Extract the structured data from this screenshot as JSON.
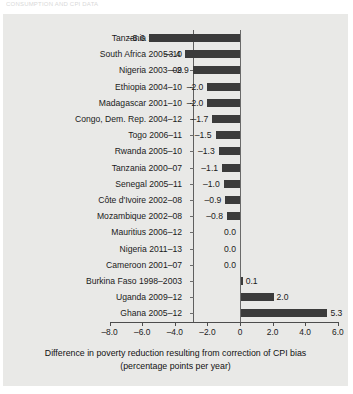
{
  "header": {
    "cut_off_text": "CONSUMPTION AND CPI DATA"
  },
  "chart_data": {
    "type": "bar",
    "orientation": "horizontal",
    "title": "",
    "xlabel": "Difference in poverty reduction resulting from correction of CPI bias (percentage points per year)",
    "ylabel": "",
    "xlim": [
      -8.0,
      6.6
    ],
    "xticks": [
      -8.0,
      -6.0,
      -4.0,
      -2.0,
      0,
      2.0,
      4.0,
      6.0
    ],
    "xtick_labels": [
      "–8.0",
      "–6.0",
      "–4.0",
      "–2.0",
      "0",
      "2.0",
      "4.0",
      "6.0"
    ],
    "grid": false,
    "legend": null,
    "bar_color": "#3b3b3b",
    "panel_color": "#e9e9e7",
    "categories": [
      "Tanzania 2008–12",
      "South Africa 2005–10",
      "Nigeria 2003–09",
      "Ethiopia 2004–10",
      "Madagascar 2001–10",
      "Congo, Dem. Rep. 2004–12",
      "Togo 2006–11",
      "Rwanda 2005–10",
      "Tanzania 2000–07",
      "Senegal 2005–11",
      "Côte d'Ivoire 2002–08",
      "Mozambique 2002–08",
      "Mauritius 2006–12",
      "Nigeria 2011–13",
      "Cameroon 2001–07",
      "Burkina Faso 1998–2003",
      "Uganda 2009–12",
      "Ghana 2005–12"
    ],
    "values": [
      -5.6,
      -3.4,
      -2.9,
      -2.0,
      -2.0,
      -1.7,
      -1.5,
      -1.3,
      -1.1,
      -1.0,
      -0.9,
      -0.8,
      0.0,
      0.0,
      0.0,
      0.1,
      2.0,
      5.3
    ],
    "value_labels": [
      "–5.6",
      "–3.4",
      "–2.9",
      "–2.0",
      "–2.0",
      "–1.7",
      "–1.5",
      "–1.3",
      "–1.1",
      "–1.0",
      "–0.9",
      "–0.8",
      "0.0",
      "0.0",
      "0.0",
      "0.1",
      "2.0",
      "5.3"
    ]
  },
  "caption": {
    "line1": "Difference in poverty reduction resulting from correction of CPI bias",
    "line2": "(percentage points per year)"
  }
}
